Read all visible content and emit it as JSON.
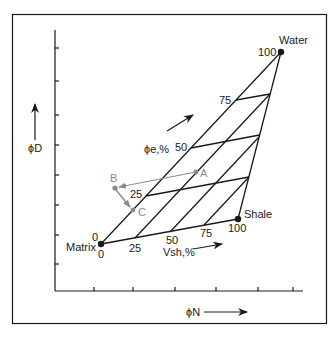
{
  "figure": {
    "y_axis_label": "ϕD",
    "x_axis_label": "ϕN",
    "endpoints": {
      "water": {
        "label": "Water",
        "value": "100"
      },
      "shale": {
        "label": "Shale",
        "value": "100"
      },
      "matrix": {
        "label": "Matrix",
        "phi_value": "0",
        "vsh_value": "0"
      }
    },
    "phi_e_label": "ϕe,%",
    "vsh_label": "Vsh,%",
    "phi_e_ticks": [
      "25",
      "50",
      "75"
    ],
    "vsh_ticks": [
      "25",
      "50",
      "75"
    ],
    "points": {
      "a": "A",
      "b": "B",
      "c": "C"
    }
  },
  "colors": {
    "line": "#1a1a1a",
    "annotation": "#8a8a8a"
  }
}
